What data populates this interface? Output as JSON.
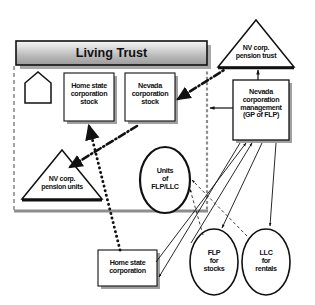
{
  "diagram": {
    "title_banner": "Living Trust",
    "nodes": {
      "house": {
        "name": "house-shape",
        "label": ""
      },
      "home_state_corp_stock": {
        "label": "Home state\ncorporation\nstock"
      },
      "nevada_corp_stock": {
        "label": "Nevada\ncorporation\nstock"
      },
      "nv_corp_pension_units": {
        "label": "NV corp.\npension units"
      },
      "units_flp_llc": {
        "label": "Units\nof\nFLP/LLC"
      },
      "home_state_corp": {
        "label": "Home state\ncorporation"
      },
      "nv_corp_pension_trust": {
        "label": "NV corp.\npension trust"
      },
      "nevada_corp_management": {
        "label": "Nevada\ncorporation\nmanagement\n(GP of FLP)"
      },
      "flp_for_stocks": {
        "label": "FLP\nfor\nstocks"
      },
      "llc_for_rentals": {
        "label": "LLC\nfor\nrentals"
      }
    },
    "colors": {
      "stroke": "#111111",
      "shadow": "#9a9a9a",
      "banner_top": "#f2f2f2",
      "banner_bottom": "#9d9d9d",
      "trust_border": "#8d8d8d",
      "fill": "#ffffff"
    },
    "edges": [
      {
        "from": "home_state_corp",
        "to": "home_state_corp_stock",
        "style": "thick-dotted",
        "arrow": "to"
      },
      {
        "from": "nevada_corp_stock",
        "to": "nv_corp_pension_units",
        "style": "dash-dot",
        "arrow": "to"
      },
      {
        "from": "nevada_corp_stock",
        "to": "nv_corp_pension_trust",
        "style": "dash-dot",
        "arrow": "to"
      },
      {
        "from": "nevada_corp_management",
        "to": "nv_corp_pension_trust",
        "style": "solid",
        "arrow": "to"
      },
      {
        "from": "nevada_corp_management",
        "to": "trust_right_edge",
        "style": "solid",
        "arrow": "to"
      },
      {
        "from": "flp_for_stocks",
        "to": "nevada_corp_management",
        "style": "solid",
        "arrow": "to"
      },
      {
        "from": "llc_for_rentals",
        "to": "nevada_corp_management",
        "style": "solid",
        "arrow": "to"
      },
      {
        "from": "home_state_corp",
        "to": "nevada_corp_management",
        "style": "solid",
        "arrow": "to"
      },
      {
        "from": "nevada_corp_management",
        "to": "flp_for_stocks",
        "style": "solid",
        "arrow": "to"
      },
      {
        "from": "nevada_corp_management",
        "to": "llc_for_rentals",
        "style": "solid",
        "arrow": "to"
      },
      {
        "from": "nevada_corp_management",
        "to": "home_state_corp",
        "style": "solid",
        "arrow": "to"
      },
      {
        "from": "flp_for_stocks",
        "to": "units_flp_llc",
        "style": "thin-dashed",
        "arrow": "to"
      },
      {
        "from": "llc_for_rentals",
        "to": "units_flp_llc",
        "style": "thin-dashed",
        "arrow": "to"
      }
    ]
  }
}
